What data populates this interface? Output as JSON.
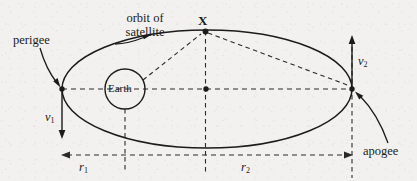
{
  "figure": {
    "type": "satellite-orbit-diagram",
    "background_color": "#f2f1ef",
    "ink_color": "#1b1b1b",
    "labels": {
      "orbit_of_line1": "orbit of",
      "orbit_of_line2": "satellite",
      "point_x": "X",
      "perigee": "perigee",
      "apogee": "apogee",
      "earth": "Earth",
      "v1": "v",
      "v1_sub": "1",
      "v2": "v",
      "v2_sub": "2",
      "r1": "r",
      "r1_sub": "1",
      "r2": "r",
      "r2_sub": "2"
    },
    "geometry": {
      "ellipse_center": [
        207,
        89
      ],
      "ellipse_semi_major": 145,
      "ellipse_semi_minor": 59,
      "earth_center": [
        125,
        89
      ],
      "earth_radius": 20,
      "focus_point": [
        207,
        89
      ],
      "perigee_point": [
        62,
        89
      ],
      "apogee_point": [
        352,
        89
      ],
      "satellite_point_x": [
        205,
        31
      ],
      "v1_arrow": {
        "from": [
          62,
          89
        ],
        "to": [
          62,
          138
        ],
        "direction": "down"
      },
      "v2_arrow": {
        "from": [
          352,
          88
        ],
        "to": [
          352,
          36
        ],
        "direction": "up"
      },
      "r1_span": [
        62,
        205
      ],
      "r2_span": [
        205,
        352
      ],
      "dimension_line_y": 155
    }
  }
}
